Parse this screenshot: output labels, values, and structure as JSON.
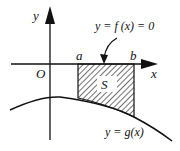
{
  "diagram": {
    "axes": {
      "x_label": "x",
      "y_label": "y",
      "origin_label": "O"
    },
    "points": {
      "a_label": "a",
      "b_label": "b"
    },
    "region": {
      "label": "S",
      "pattern": "diagonal-hatch"
    },
    "curves": {
      "f_label": "y = f (x) = 0",
      "g_label": "y = g(x)"
    }
  }
}
